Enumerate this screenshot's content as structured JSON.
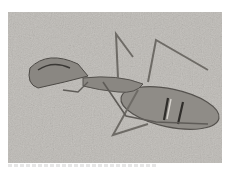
{
  "image": {
    "subject": "insect-on-sand",
    "background_color": "#b9b6b1",
    "body_color": "#8e8b86",
    "leg_color": "#75726d"
  },
  "caption": {
    "text": ""
  }
}
